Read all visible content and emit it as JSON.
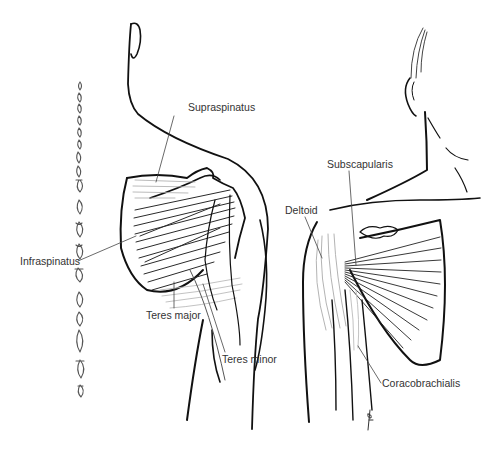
{
  "figure": {
    "views": [
      {
        "id": "posterior",
        "labels": [
          {
            "key": "supraspinatus",
            "text": "Supraspinatus",
            "x": 188,
            "y": 102
          },
          {
            "key": "infraspinatus",
            "text": "Infraspinatus",
            "x": 20,
            "y": 258
          },
          {
            "key": "teres_major",
            "text": "Teres major",
            "x": 146,
            "y": 310
          },
          {
            "key": "teres_minor",
            "text": "Teres minor",
            "x": 222,
            "y": 354
          }
        ]
      },
      {
        "id": "anterior",
        "labels": [
          {
            "key": "subscapularis",
            "text": "Subscapularis",
            "x": 327,
            "y": 159
          },
          {
            "key": "deltoid",
            "text": "Deltoid",
            "x": 285,
            "y": 205
          },
          {
            "key": "coracobrachialis",
            "text": "Coracobrachialis",
            "x": 382,
            "y": 378
          }
        ]
      }
    ],
    "signature": "BARLICK",
    "colors": {
      "outline": "#111111",
      "muscle_dark": "#2a2a2a",
      "muscle_light": "#b5b5b5",
      "label_text": "#333333",
      "leader_line": "#444444"
    }
  }
}
